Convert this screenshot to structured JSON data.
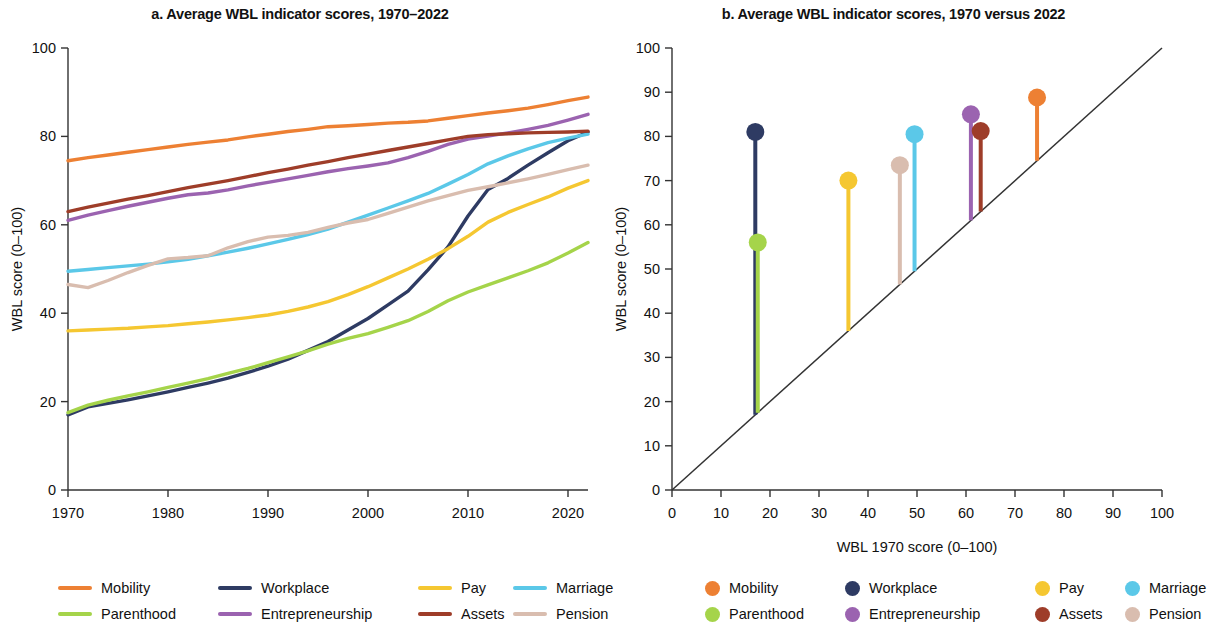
{
  "figure": {
    "panel_a_title": "a. Average WBL indicator scores, 1970–2022",
    "panel_b_title": "b. Average WBL indicator scores, 1970 versus 2022"
  },
  "colors": {
    "mobility": "#ED8033",
    "parenthood": "#A5D44A",
    "workplace": "#2E3B63",
    "entrepreneurship": "#9B63B0",
    "pay": "#F5C731",
    "assets": "#9E3D29",
    "marriage": "#5BC8E8",
    "pension": "#D9BDAF",
    "axis": "#333333",
    "diagonal": "#333333"
  },
  "legend_a": {
    "items": [
      {
        "label": "Mobility",
        "color_key": "mobility"
      },
      {
        "label": "Workplace",
        "color_key": "workplace"
      },
      {
        "label": "Pay",
        "color_key": "pay"
      },
      {
        "label": "Marriage",
        "color_key": "marriage"
      },
      {
        "label": "Parenthood",
        "color_key": "parenthood"
      },
      {
        "label": "Entrepreneurship",
        "color_key": "entrepreneurship"
      },
      {
        "label": "Assets",
        "color_key": "assets"
      },
      {
        "label": "Pension",
        "color_key": "pension"
      }
    ]
  },
  "legend_b": {
    "items": [
      {
        "label": "Mobility",
        "color_key": "mobility"
      },
      {
        "label": "Workplace",
        "color_key": "workplace"
      },
      {
        "label": "Pay",
        "color_key": "pay"
      },
      {
        "label": "Marriage",
        "color_key": "marriage"
      },
      {
        "label": "Parenthood",
        "color_key": "parenthood"
      },
      {
        "label": "Entrepreneurship",
        "color_key": "entrepreneurship"
      },
      {
        "label": "Assets",
        "color_key": "assets"
      },
      {
        "label": "Pension",
        "color_key": "pension"
      }
    ]
  },
  "chart_data": [
    {
      "type": "line",
      "panel": "a",
      "title": "a. Average WBL indicator scores, 1970–2022",
      "xlabel": "",
      "ylabel": "WBL score (0–100)",
      "xlim": [
        1970,
        2022
      ],
      "ylim": [
        0,
        100
      ],
      "xticks": [
        1970,
        1980,
        1990,
        2000,
        2010,
        2020
      ],
      "yticks": [
        0,
        20,
        40,
        60,
        80,
        100
      ],
      "xtick_labels": [
        "1970",
        "1980",
        "1990",
        "2000",
        "2010",
        "2020"
      ],
      "ytick_labels": [
        "0",
        "20",
        "40",
        "60",
        "80",
        "100"
      ],
      "grid": false,
      "legend_position": "bottom",
      "x": [
        1970,
        1972,
        1974,
        1976,
        1978,
        1980,
        1982,
        1984,
        1986,
        1988,
        1990,
        1992,
        1994,
        1996,
        1998,
        2000,
        2002,
        2004,
        2006,
        2008,
        2010,
        2012,
        2014,
        2016,
        2018,
        2020,
        2022
      ],
      "series": [
        {
          "name": "Mobility",
          "color_key": "mobility",
          "values": [
            74.5,
            75.2,
            75.8,
            76.4,
            77.0,
            77.6,
            78.2,
            78.7,
            79.2,
            79.9,
            80.5,
            81.1,
            81.6,
            82.2,
            82.4,
            82.7,
            83.0,
            83.2,
            83.5,
            84.1,
            84.7,
            85.3,
            85.8,
            86.4,
            87.2,
            88.1,
            88.9
          ]
        },
        {
          "name": "Workplace",
          "color_key": "workplace",
          "values": [
            17.0,
            18.8,
            19.6,
            20.4,
            21.3,
            22.2,
            23.2,
            24.2,
            25.3,
            26.6,
            28.0,
            29.6,
            31.6,
            33.6,
            36.2,
            38.8,
            41.9,
            45.0,
            49.8,
            55.0,
            62.0,
            68.0,
            70.5,
            73.5,
            76.3,
            79.0,
            81.0
          ]
        },
        {
          "name": "Pay",
          "color_key": "pay",
          "values": [
            36.0,
            36.2,
            36.4,
            36.6,
            36.9,
            37.2,
            37.6,
            38.0,
            38.5,
            39.0,
            39.6,
            40.4,
            41.4,
            42.6,
            44.2,
            46.0,
            48.0,
            50.0,
            52.2,
            54.6,
            57.4,
            60.6,
            62.8,
            64.6,
            66.3,
            68.3,
            70.0
          ]
        },
        {
          "name": "Marriage",
          "color_key": "marriage",
          "values": [
            49.5,
            49.9,
            50.3,
            50.7,
            51.1,
            51.6,
            52.2,
            53.0,
            53.8,
            54.7,
            55.7,
            56.7,
            57.8,
            59.0,
            60.6,
            62.2,
            63.8,
            65.4,
            67.1,
            69.2,
            71.4,
            73.8,
            75.6,
            77.2,
            78.6,
            79.6,
            80.5
          ]
        },
        {
          "name": "Parenthood",
          "color_key": "parenthood",
          "values": [
            17.5,
            19.2,
            20.3,
            21.3,
            22.2,
            23.2,
            24.2,
            25.2,
            26.4,
            27.5,
            28.8,
            30.1,
            31.5,
            33.0,
            34.3,
            35.4,
            36.8,
            38.3,
            40.4,
            42.8,
            44.8,
            46.4,
            48.0,
            49.6,
            51.4,
            53.6,
            56.0
          ]
        },
        {
          "name": "Entrepreneurship",
          "color_key": "entrepreneurship",
          "values": [
            61.0,
            62.2,
            63.2,
            64.2,
            65.1,
            66.0,
            66.8,
            67.2,
            67.9,
            68.8,
            69.6,
            70.4,
            71.2,
            72.0,
            72.7,
            73.3,
            74.0,
            75.2,
            76.6,
            78.2,
            79.4,
            80.1,
            80.8,
            81.6,
            82.5,
            83.7,
            85.0
          ]
        },
        {
          "name": "Assets",
          "color_key": "assets",
          "values": [
            63.0,
            64.0,
            64.9,
            65.8,
            66.6,
            67.5,
            68.4,
            69.2,
            70.0,
            70.9,
            71.8,
            72.6,
            73.5,
            74.3,
            75.2,
            76.0,
            76.8,
            77.6,
            78.4,
            79.2,
            80.0,
            80.4,
            80.6,
            80.8,
            80.9,
            81.0,
            81.2
          ]
        },
        {
          "name": "Pension",
          "color_key": "pension",
          "values": [
            46.5,
            45.8,
            47.4,
            49.2,
            50.8,
            52.3,
            52.6,
            53.0,
            54.8,
            56.2,
            57.2,
            57.6,
            58.3,
            59.4,
            60.4,
            61.2,
            62.6,
            64.0,
            65.4,
            66.6,
            67.8,
            68.6,
            69.5,
            70.4,
            71.4,
            72.5,
            73.5
          ]
        }
      ]
    },
    {
      "type": "scatter",
      "panel": "b",
      "title": "b. Average WBL indicator scores, 1970 versus 2022",
      "xlabel": "WBL 1970 score (0–100)",
      "ylabel": "WBL score (0–100)",
      "xlim": [
        0,
        100
      ],
      "ylim": [
        0,
        100
      ],
      "xticks": [
        0,
        10,
        20,
        30,
        40,
        50,
        60,
        70,
        80,
        90,
        100
      ],
      "yticks": [
        0,
        10,
        20,
        30,
        40,
        50,
        60,
        70,
        80,
        90,
        100
      ],
      "xtick_labels": [
        "0",
        "10",
        "20",
        "30",
        "40",
        "50",
        "60",
        "70",
        "80",
        "90",
        "100"
      ],
      "ytick_labels": [
        "0",
        "10",
        "20",
        "30",
        "40",
        "50",
        "60",
        "70",
        "80",
        "90",
        "100"
      ],
      "grid": false,
      "legend_position": "bottom",
      "reference_line": {
        "type": "45-degree",
        "from": [
          0,
          0
        ],
        "to": [
          100,
          100
        ]
      },
      "points": [
        {
          "name": "Workplace",
          "color_key": "workplace",
          "x": 17.0,
          "y": 81.0
        },
        {
          "name": "Parenthood",
          "color_key": "parenthood",
          "x": 17.5,
          "y": 56.0
        },
        {
          "name": "Pay",
          "color_key": "pay",
          "x": 36.0,
          "y": 70.0
        },
        {
          "name": "Pension",
          "color_key": "pension",
          "x": 46.5,
          "y": 73.5
        },
        {
          "name": "Marriage",
          "color_key": "marriage",
          "x": 49.5,
          "y": 80.5
        },
        {
          "name": "Entrepreneurship",
          "color_key": "entrepreneurship",
          "x": 61.0,
          "y": 85.0
        },
        {
          "name": "Assets",
          "color_key": "assets",
          "x": 63.0,
          "y": 81.2
        },
        {
          "name": "Mobility",
          "color_key": "mobility",
          "x": 74.5,
          "y": 88.8
        }
      ]
    }
  ]
}
